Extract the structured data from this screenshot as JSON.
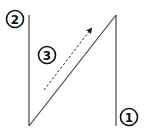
{
  "diagram": {
    "type": "line-sketch",
    "colors": {
      "stroke": "#333333",
      "background": "#ffffff"
    },
    "labels": [
      {
        "id": "label-1",
        "text": "1",
        "cx": 129,
        "cy": 117
      },
      {
        "id": "label-2",
        "text": "2",
        "cx": 15,
        "cy": 19
      },
      {
        "id": "label-3",
        "text": "3",
        "cx": 47,
        "cy": 55
      }
    ],
    "lines": [
      {
        "id": "left-vertical",
        "x1": 29,
        "y1": 15,
        "x2": 29,
        "y2": 126
      },
      {
        "id": "diagonal",
        "x1": 29,
        "y1": 126,
        "x2": 116,
        "y2": 15
      },
      {
        "id": "right-vertical",
        "x1": 116,
        "y1": 15,
        "x2": 116,
        "y2": 126
      }
    ],
    "arrow": {
      "id": "dashed-arrow",
      "x1": 44,
      "y1": 90,
      "x2": 92,
      "y2": 28,
      "style": "dashed"
    }
  }
}
